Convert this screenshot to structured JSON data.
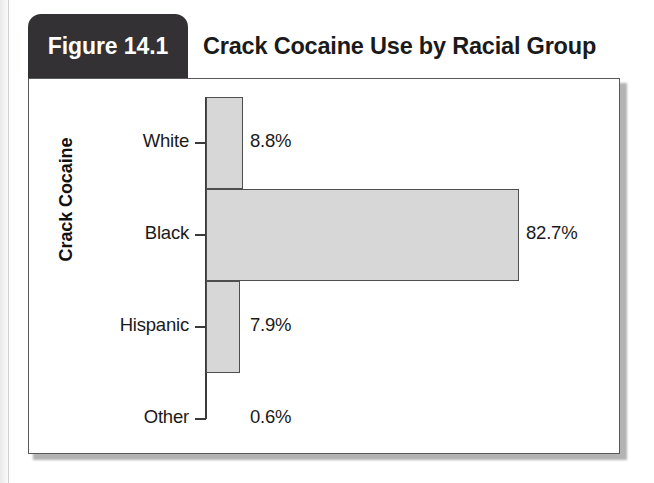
{
  "figure": {
    "tab_label": "Figure 14.1",
    "title": "Crack Cocaine Use by Racial Group"
  },
  "chart_data": {
    "type": "bar",
    "orientation": "horizontal",
    "title": "Crack Cocaine Use by Racial Group",
    "xlabel": "",
    "ylabel": "Crack Cocaine",
    "categories": [
      "White",
      "Black",
      "Hispanic",
      "Other"
    ],
    "values": [
      8.8,
      82.7,
      7.9,
      0.6
    ],
    "value_labels": [
      "8.8%",
      "7.9%",
      "82.7%",
      "0.6%"
    ],
    "unit": "%",
    "xlim": [
      0,
      100
    ],
    "grid": false,
    "legend": false,
    "bars": [
      {
        "category": "White",
        "value": 8.8,
        "label": "8.8%",
        "bar_px": 37,
        "label_x_px": 221
      },
      {
        "category": "Black",
        "value": 82.7,
        "label": "82.7%",
        "bar_px": 313,
        "label_x_px": 497
      },
      {
        "category": "Hispanic",
        "value": 7.9,
        "label": "7.9%",
        "bar_px": 34,
        "label_x_px": 221
      },
      {
        "category": "Other",
        "value": 0.6,
        "label": "0.6%",
        "bar_px": 0,
        "label_x_px": 221
      }
    ],
    "colors": {
      "bar_fill": "#d7d7d7",
      "bar_border": "#4e4e4e",
      "axis": "#3a3a3a",
      "text": "#1a1a1a",
      "tab_background": "#333133",
      "tab_text": "#ffffff",
      "frame_border": "#59595b"
    }
  }
}
